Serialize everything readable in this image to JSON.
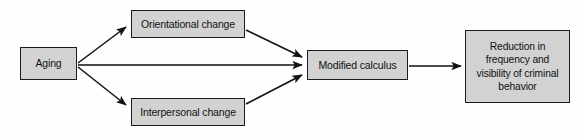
{
  "diagram": {
    "background_color": "#fefefe",
    "node_fill_color": "#d2d2d2",
    "node_border_color": "#1b1b1b",
    "edge_color": "#111111",
    "nodes": [
      {
        "id": "aging",
        "label": "Aging"
      },
      {
        "id": "orientational",
        "label": "Orientational change"
      },
      {
        "id": "interpersonal",
        "label": "Interpersonal change"
      },
      {
        "id": "modified",
        "label": "Modified calculus"
      },
      {
        "id": "reduction",
        "label": "Reduction in\nfrequency and\nvisibility of criminal\nbehavior"
      }
    ],
    "edges": [
      {
        "id": "aging-to-orientational",
        "from": "Aging",
        "to": "Orientational change",
        "arrow": "single"
      },
      {
        "id": "aging-to-modified",
        "from": "Aging",
        "to": "Modified calculus",
        "arrow": "single"
      },
      {
        "id": "aging-to-interpersonal",
        "from": "Aging",
        "to": "Interpersonal change",
        "arrow": "single"
      },
      {
        "id": "orientational-to-modified",
        "from": "Orientational change",
        "to": "Modified calculus",
        "arrow": "single"
      },
      {
        "id": "interpersonal-to-modified",
        "from": "Interpersonal change",
        "to": "Modified calculus",
        "arrow": "single"
      },
      {
        "id": "modified-to-reduction",
        "from": "Modified calculus",
        "to": "Reduction in frequency and visibility of criminal behavior",
        "arrow": "single"
      }
    ]
  }
}
